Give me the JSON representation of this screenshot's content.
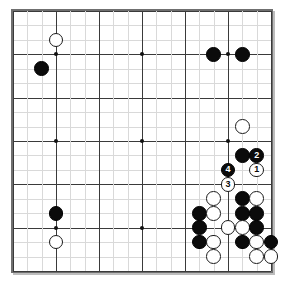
{
  "board": {
    "name": "go-board",
    "size": 19,
    "line_color": "#d9d9d9",
    "major_line_color": "#3a3a3a",
    "border_color": "#6f6f6f",
    "background_color": "#ffffff",
    "black_color": "#0b0b0b",
    "white_color": "#ffffff",
    "major_rows": [
      1,
      4,
      7,
      10,
      13,
      16,
      19
    ],
    "major_cols": [
      1,
      4,
      7,
      10,
      13,
      16,
      19
    ],
    "hoshi": [
      {
        "col": 4,
        "row": 4
      },
      {
        "col": 10,
        "row": 4
      },
      {
        "col": 16,
        "row": 4
      },
      {
        "col": 4,
        "row": 10
      },
      {
        "col": 10,
        "row": 10
      },
      {
        "col": 16,
        "row": 10
      },
      {
        "col": 4,
        "row": 16
      },
      {
        "col": 10,
        "row": 16
      },
      {
        "col": 16,
        "row": 16
      }
    ],
    "stones": [
      {
        "col": 4,
        "row": 3,
        "color": "white",
        "label": ""
      },
      {
        "col": 3,
        "row": 5,
        "color": "black",
        "label": ""
      },
      {
        "col": 15,
        "row": 4,
        "color": "black",
        "label": ""
      },
      {
        "col": 17,
        "row": 4,
        "color": "black",
        "label": ""
      },
      {
        "col": 17,
        "row": 9,
        "color": "white",
        "label": ""
      },
      {
        "col": 17,
        "row": 11,
        "color": "black",
        "label": ""
      },
      {
        "col": 18,
        "row": 11,
        "color": "black",
        "label": "2"
      },
      {
        "col": 18,
        "row": 12,
        "color": "white",
        "label": "1"
      },
      {
        "col": 16,
        "row": 12,
        "color": "black",
        "label": "4"
      },
      {
        "col": 16,
        "row": 13,
        "color": "white",
        "label": "3"
      },
      {
        "col": 15,
        "row": 14,
        "color": "white",
        "label": ""
      },
      {
        "col": 17,
        "row": 14,
        "color": "black",
        "label": ""
      },
      {
        "col": 18,
        "row": 14,
        "color": "white",
        "label": ""
      },
      {
        "col": 14,
        "row": 15,
        "color": "black",
        "label": ""
      },
      {
        "col": 15,
        "row": 15,
        "color": "white",
        "label": ""
      },
      {
        "col": 17,
        "row": 15,
        "color": "black",
        "label": ""
      },
      {
        "col": 18,
        "row": 15,
        "color": "black",
        "label": ""
      },
      {
        "col": 14,
        "row": 16,
        "color": "black",
        "label": ""
      },
      {
        "col": 16,
        "row": 16,
        "color": "white",
        "label": ""
      },
      {
        "col": 17,
        "row": 16,
        "color": "white",
        "label": ""
      },
      {
        "col": 18,
        "row": 16,
        "color": "black",
        "label": ""
      },
      {
        "col": 14,
        "row": 17,
        "color": "black",
        "label": ""
      },
      {
        "col": 15,
        "row": 17,
        "color": "white",
        "label": ""
      },
      {
        "col": 17,
        "row": 17,
        "color": "black",
        "label": ""
      },
      {
        "col": 18,
        "row": 17,
        "color": "white",
        "label": ""
      },
      {
        "col": 19,
        "row": 17,
        "color": "black",
        "label": ""
      },
      {
        "col": 4,
        "row": 15,
        "color": "black",
        "label": ""
      },
      {
        "col": 4,
        "row": 17,
        "color": "white",
        "label": ""
      },
      {
        "col": 15,
        "row": 18,
        "color": "white",
        "label": ""
      },
      {
        "col": 18,
        "row": 18,
        "color": "white",
        "label": ""
      },
      {
        "col": 19,
        "row": 18,
        "color": "white",
        "label": ""
      }
    ],
    "move_sequence": [
      {
        "number": "1",
        "color": "white",
        "col": 18,
        "row": 12
      },
      {
        "number": "2",
        "color": "black",
        "col": 18,
        "row": 11
      },
      {
        "number": "3",
        "color": "white",
        "col": 16,
        "row": 13
      },
      {
        "number": "4",
        "color": "black",
        "col": 16,
        "row": 12
      }
    ]
  }
}
